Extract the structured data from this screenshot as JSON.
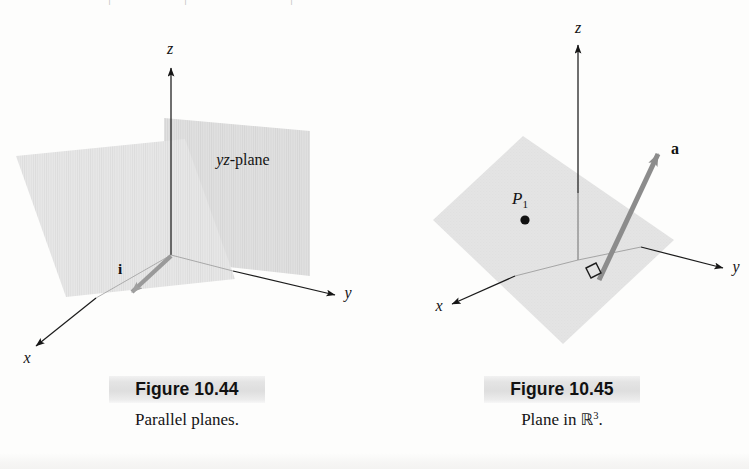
{
  "page": {
    "width": 749,
    "height": 469,
    "background": "#fdfdfc",
    "top_bleed_marks": [
      "|",
      "|",
      "|",
      "·",
      "·"
    ]
  },
  "colors": {
    "plane_fill": "#e3e3e3",
    "plane_fill_light": "#eaeaea",
    "plane_fill_dark": "#d9d9d9",
    "axis_stroke": "#1b1b1b",
    "vector_stroke": "#9a9a9a",
    "vector_stroke_dark": "#8c8c8c",
    "text": "#141414",
    "caption_band": "#e4e4e4"
  },
  "figures": [
    {
      "id": "figure-10-44",
      "caption_title": "Figure 10.44",
      "caption_text": "Parallel planes.",
      "type": "parallel-planes",
      "axes": [
        {
          "name": "z",
          "label": "z",
          "style": "italic",
          "label_x": 170,
          "label_y": 46
        },
        {
          "name": "y",
          "label": "y",
          "style": "italic",
          "label_x": 348,
          "label_y": 288
        },
        {
          "name": "x",
          "label": "x",
          "style": "italic",
          "label_x": 27,
          "label_y": 355
        }
      ],
      "planes": [
        {
          "name": "yz-plane",
          "label": "yz-plane",
          "label_x": 243,
          "label_y": 157
        },
        {
          "name": "parallel-plane",
          "label": "",
          "label_x": 0,
          "label_y": 0
        }
      ],
      "vectors": [
        {
          "name": "i",
          "label": "i",
          "style": "bold",
          "label_x": 120,
          "label_y": 266,
          "color": "#9a9a9a"
        }
      ]
    },
    {
      "id": "figure-10-45",
      "caption_title": "Figure 10.45",
      "caption_text_prefix": "Plane in ",
      "caption_text_symbol": "ℝ",
      "caption_text_exponent": "3",
      "caption_text_suffix": ".",
      "type": "plane-in-r3",
      "axes": [
        {
          "name": "z",
          "label": "z",
          "style": "italic",
          "label_x": 577,
          "label_y": 33
        },
        {
          "name": "y",
          "label": "y",
          "style": "italic",
          "label_x": 735,
          "label_y": 266
        },
        {
          "name": "x",
          "label": "x",
          "style": "italic",
          "label_x": 438,
          "label_y": 303
        }
      ],
      "points": [
        {
          "name": "P1",
          "label": "P",
          "subscript": "1",
          "label_x": 520,
          "label_y": 195,
          "dot_x": 524,
          "dot_y": 212
        }
      ],
      "vectors": [
        {
          "name": "a",
          "label": "a",
          "style": "bold",
          "label_x": 672,
          "label_y": 148,
          "color": "#8c8c8c"
        }
      ],
      "markers": [
        {
          "name": "right-angle-marker",
          "x": 594,
          "y": 262
        }
      ],
      "planes": [
        {
          "name": "plane",
          "label": "",
          "label_x": 0,
          "label_y": 0
        }
      ]
    }
  ]
}
